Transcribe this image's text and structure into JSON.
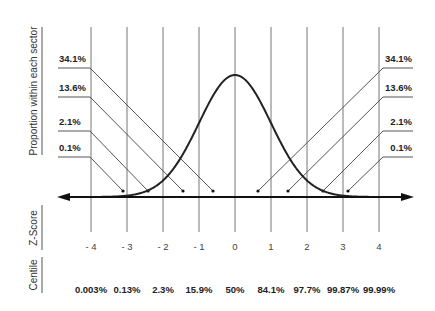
{
  "side_labels": {
    "proportion": "Proportion within each sector",
    "zscore": "Z-Score",
    "centile": "Centile"
  },
  "left_leaders": [
    {
      "label": "34.1%",
      "y": 68,
      "knee_x": 90,
      "dot_x": 213
    },
    {
      "label": "13.6%",
      "y": 97,
      "knee_x": 90,
      "dot_x": 183
    },
    {
      "label": "2.1%",
      "y": 131,
      "knee_x": 90,
      "dot_x": 148
    },
    {
      "label": "0.1%",
      "y": 157,
      "knee_x": 90,
      "dot_x": 123
    }
  ],
  "right_leaders": [
    {
      "label": "34.1%",
      "y": 68,
      "knee_x": 383,
      "dot_x": 258
    },
    {
      "label": "13.6%",
      "y": 97,
      "knee_x": 383,
      "dot_x": 288
    },
    {
      "label": "2.1%",
      "y": 131,
      "knee_x": 383,
      "dot_x": 323
    },
    {
      "label": "0.1%",
      "y": 157,
      "knee_x": 383,
      "dot_x": 348
    }
  ],
  "z_scores": [
    "- 4",
    "- 3",
    "- 2",
    "- 1",
    "0",
    "1",
    "2",
    "3",
    "4"
  ],
  "centiles": [
    "0.003%",
    "0.13%",
    "2.3%",
    "15.9%",
    "50%",
    "84.1%",
    "97.7%",
    "99.87%",
    "99.99%"
  ],
  "colors": {
    "curve": "#222222",
    "axis": "#111111",
    "grid": "#666666",
    "leader": "#555555",
    "text": "#222222"
  }
}
